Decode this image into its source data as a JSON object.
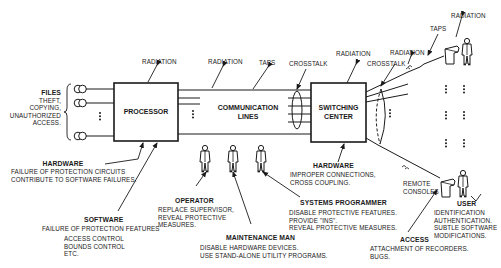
{
  "components": {
    "processor": {
      "label": "PROCESSOR"
    },
    "communication_lines": {
      "label_line1": "COMMUNICATION",
      "label_line2": "LINES"
    },
    "switching_center": {
      "label_line1": "SWITCHING",
      "label_line2": "CENTER"
    }
  },
  "threats": {
    "files": {
      "title": "FILES",
      "lines": [
        "THEFT,",
        "COPYING,",
        "UNAUTHORIZED",
        "ACCESS."
      ]
    },
    "processor_radiation": "RADIATION",
    "line_radiation": "RADIATION",
    "line_taps": "TAPS",
    "line_crosstalk": "CROSSTALK",
    "switch_radiation": "RADIATION",
    "switch_crosstalk": "CROSSTALK",
    "remote_radiation": "RADIATION",
    "remote_taps": "TAPS",
    "remote_top_radiation": "RADIATION",
    "hardware_processor": {
      "title": "HARDWARE",
      "lines": [
        "FAILURE OF PROTECTION CIRCUITS",
        "CONTRIBUTE TO SOFTWARE FAILURES."
      ]
    },
    "software": {
      "title": "SOFTWARE",
      "lines": [
        "FAILURE OF PROTECTION FEATURES"
      ],
      "sub_lines": [
        "ACCESS CONTROL",
        "BOUNDS CONTROL",
        "ETC."
      ]
    },
    "operator": {
      "title": "OPERATOR",
      "lines": [
        "REPLACE SUPERVISOR,",
        "REVEAL PROTECTIVE",
        "MEASURES."
      ]
    },
    "maintenance_man": {
      "title": "MAINTENANCE MAN",
      "lines": [
        "DISABLE HARDWARE DEVICES.",
        "USE STAND-ALONE UTILITY PROGRAMS."
      ]
    },
    "systems_programmer": {
      "title": "SYSTEMS PROGRAMMER",
      "lines": [
        "DISABLE PROTECTIVE FEATURES.",
        "PROVIDE \"INS\".",
        "REVEAL PROTECTIVE MEASURES."
      ]
    },
    "hardware_switch": {
      "title": "HARDWARE",
      "lines": [
        "IMPROPER CONNECTIONS,",
        "CROSS COUPLING."
      ]
    },
    "remote_consoles": {
      "lines": [
        "REMOTE",
        "CONSOLES"
      ]
    },
    "access": {
      "title": "ACCESS",
      "lines": [
        "ATTACHMENT OF RECORDERS.",
        "BUGS."
      ]
    },
    "user": {
      "title": "USER",
      "lines": [
        "IDENTIFICATION",
        "AUTHENTICATION.",
        "SUBTLE SOFTWARE",
        "MODIFICATIONS."
      ]
    }
  },
  "colors": {
    "ink": "#1a1a1a",
    "background": "#ffffff"
  }
}
